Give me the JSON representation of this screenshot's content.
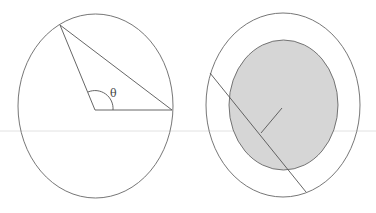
{
  "figures": [
    {
      "id": "left",
      "description": "Circle with central angle theta and inscribed chord triangle",
      "angle_label": "θ"
    },
    {
      "id": "right",
      "description": "Outer circle with shaded inner circle, a chord line and a perpendicular radius segment"
    }
  ],
  "colors": {
    "stroke": "#555555",
    "shade": "#d6d6d6",
    "background": "#ffffff"
  }
}
